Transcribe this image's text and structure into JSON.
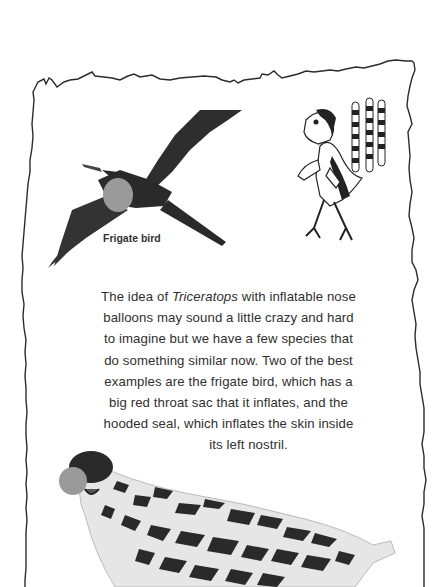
{
  "illustrations": {
    "frigate_bird": {
      "caption": "Frigate bird",
      "icon": "frigate-bird-illustration",
      "throat_sac_color": "#9a9a9a",
      "body_color": "#333333"
    },
    "feathered_dinosaur": {
      "icon": "feathered-dinosaur-illustration"
    },
    "hooded_seal": {
      "icon": "hooded-seal-illustration",
      "nostril_balloon_color": "#9a9a9a"
    }
  },
  "body": {
    "prefix": "The idea of ",
    "italic_term": "Triceratops",
    "line1_rest": " with inflatable nose",
    "line2": "balloons may sound a little crazy and hard",
    "line3": "to imagine but we have a few species that",
    "line4": "do something similar now. Two of the best",
    "line5": "examples are the frigate bird, which has a",
    "line6": "big red throat sac that it inflates, and the",
    "line7": "hooded seal, which inflates the skin inside",
    "line8": "its left nostril."
  },
  "colors": {
    "background": "#ffffff",
    "border": "#2b2b2b",
    "text": "#2f2f2f"
  }
}
